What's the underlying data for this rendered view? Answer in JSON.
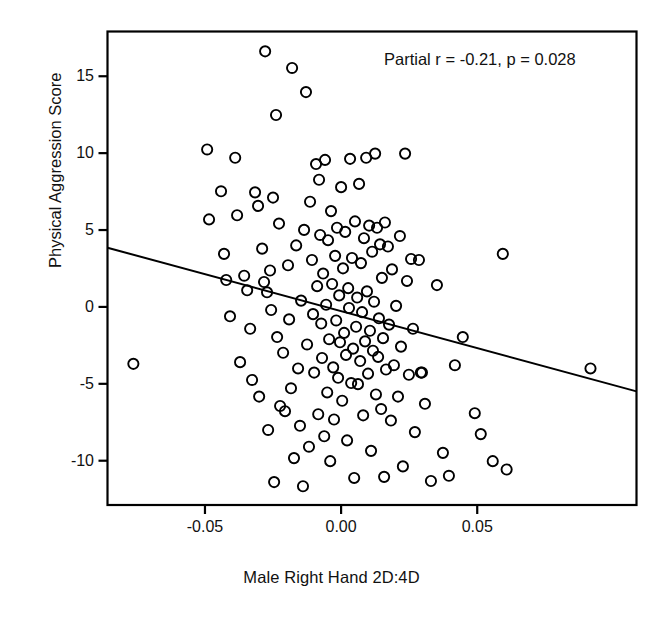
{
  "chart_data": {
    "type": "scatter",
    "title": "",
    "xlabel": "Male Right Hand 2D:4D",
    "ylabel": "Physical Aggression Score",
    "annotation": "Partial r = -0.21, p = 0.028",
    "partial_r": -0.21,
    "p_value": 0.028,
    "grid": false,
    "legend": "none",
    "xlim": [
      -0.0858,
      0.1085
    ],
    "ylim": [
      -12.88,
      17.91
    ],
    "xticks": [
      -0.05,
      0.0,
      0.05
    ],
    "xticklabels": [
      "-0.05",
      "0.00",
      "0.05"
    ],
    "yticks": [
      -10,
      -5,
      0,
      5,
      10,
      15
    ],
    "yticklabels": [
      "-10",
      "-5",
      "0",
      "5",
      "10",
      "15"
    ],
    "marker": "open-circle",
    "marker_color": "#000000",
    "n_points": 152,
    "trendline": {
      "type": "linear",
      "x_start": -0.0858,
      "y_start": 3.85,
      "x_end": 0.1085,
      "y_end": -5.49,
      "color": "#000000"
    },
    "points": [
      {
        "x": -0.0763,
        "y": -3.7
      },
      {
        "x": -0.0492,
        "y": 10.24
      },
      {
        "x": -0.0485,
        "y": 5.69
      },
      {
        "x": -0.0441,
        "y": 7.52
      },
      {
        "x": -0.043,
        "y": 3.45
      },
      {
        "x": -0.0422,
        "y": 1.75
      },
      {
        "x": -0.0408,
        "y": -0.61
      },
      {
        "x": -0.0389,
        "y": 9.7
      },
      {
        "x": -0.0382,
        "y": 5.96
      },
      {
        "x": -0.0371,
        "y": -3.59
      },
      {
        "x": -0.0356,
        "y": 2.03
      },
      {
        "x": -0.0345,
        "y": 1.08
      },
      {
        "x": -0.0334,
        "y": -1.42
      },
      {
        "x": -0.0327,
        "y": -4.75
      },
      {
        "x": -0.0316,
        "y": 7.45
      },
      {
        "x": -0.0305,
        "y": 6.57
      },
      {
        "x": -0.0301,
        "y": -5.83
      },
      {
        "x": -0.029,
        "y": 3.79
      },
      {
        "x": -0.0283,
        "y": 1.62
      },
      {
        "x": -0.0279,
        "y": 16.62
      },
      {
        "x": -0.0272,
        "y": 0.95
      },
      {
        "x": -0.0268,
        "y": -8.0
      },
      {
        "x": -0.0261,
        "y": 2.37
      },
      {
        "x": -0.0257,
        "y": -0.2
      },
      {
        "x": -0.025,
        "y": 7.11
      },
      {
        "x": -0.0246,
        "y": -11.39
      },
      {
        "x": -0.0239,
        "y": 12.48
      },
      {
        "x": -0.0235,
        "y": -1.96
      },
      {
        "x": -0.0228,
        "y": 5.42
      },
      {
        "x": -0.0224,
        "y": -6.44
      },
      {
        "x": -0.0213,
        "y": -2.98
      },
      {
        "x": -0.0206,
        "y": -6.78
      },
      {
        "x": -0.0195,
        "y": 2.71
      },
      {
        "x": -0.0191,
        "y": -0.81
      },
      {
        "x": -0.0184,
        "y": -5.29
      },
      {
        "x": -0.018,
        "y": 15.54
      },
      {
        "x": -0.0173,
        "y": -9.83
      },
      {
        "x": -0.0165,
        "y": 4.0
      },
      {
        "x": -0.0158,
        "y": -4.0
      },
      {
        "x": -0.0151,
        "y": -7.73
      },
      {
        "x": -0.0147,
        "y": 0.41
      },
      {
        "x": -0.014,
        "y": -11.66
      },
      {
        "x": -0.0136,
        "y": 5.01
      },
      {
        "x": -0.0129,
        "y": 13.97
      },
      {
        "x": -0.0125,
        "y": -2.44
      },
      {
        "x": -0.0118,
        "y": -9.09
      },
      {
        "x": -0.0114,
        "y": 6.84
      },
      {
        "x": -0.0107,
        "y": 3.05
      },
      {
        "x": -0.0103,
        "y": -0.47
      },
      {
        "x": -0.0099,
        "y": -4.27
      },
      {
        "x": -0.0092,
        "y": 9.29
      },
      {
        "x": -0.0088,
        "y": 1.35
      },
      {
        "x": -0.0084,
        "y": -6.98
      },
      {
        "x": -0.0081,
        "y": 8.27
      },
      {
        "x": -0.0077,
        "y": 4.68
      },
      {
        "x": -0.0073,
        "y": -1.08
      },
      {
        "x": -0.007,
        "y": -3.32
      },
      {
        "x": -0.0066,
        "y": 2.17
      },
      {
        "x": -0.0062,
        "y": -8.41
      },
      {
        "x": -0.0059,
        "y": 9.56
      },
      {
        "x": -0.0055,
        "y": 0.14
      },
      {
        "x": -0.0051,
        "y": -5.56
      },
      {
        "x": -0.0048,
        "y": 4.34
      },
      {
        "x": -0.0044,
        "y": -2.1
      },
      {
        "x": -0.004,
        "y": -10.03
      },
      {
        "x": -0.0037,
        "y": 6.23
      },
      {
        "x": -0.0033,
        "y": 1.49
      },
      {
        "x": -0.0029,
        "y": -3.93
      },
      {
        "x": -0.0026,
        "y": -7.32
      },
      {
        "x": -0.0022,
        "y": 3.32
      },
      {
        "x": -0.0018,
        "y": -0.88
      },
      {
        "x": -0.0015,
        "y": 5.15
      },
      {
        "x": -0.0011,
        "y": -4.61
      },
      {
        "x": -0.0007,
        "y": 0.75
      },
      {
        "x": -0.0004,
        "y": -2.3
      },
      {
        "x": 0.0,
        "y": 7.79
      },
      {
        "x": 0.0004,
        "y": -6.1
      },
      {
        "x": 0.0007,
        "y": 2.51
      },
      {
        "x": 0.0011,
        "y": -1.69
      },
      {
        "x": 0.0015,
        "y": 4.88
      },
      {
        "x": 0.0018,
        "y": -3.12
      },
      {
        "x": 0.0022,
        "y": -8.68
      },
      {
        "x": 0.0026,
        "y": 1.22
      },
      {
        "x": 0.0029,
        "y": -0.07
      },
      {
        "x": 0.0033,
        "y": 9.63
      },
      {
        "x": 0.0037,
        "y": -4.95
      },
      {
        "x": 0.004,
        "y": 3.18
      },
      {
        "x": 0.0044,
        "y": -2.71
      },
      {
        "x": 0.0048,
        "y": -11.12
      },
      {
        "x": 0.0051,
        "y": 5.56
      },
      {
        "x": 0.0055,
        "y": -1.29
      },
      {
        "x": 0.0059,
        "y": 0.61
      },
      {
        "x": 0.0062,
        "y": -5.02
      },
      {
        "x": 0.0066,
        "y": 8.0
      },
      {
        "x": 0.007,
        "y": -3.52
      },
      {
        "x": 0.0073,
        "y": 2.85
      },
      {
        "x": 0.0077,
        "y": -0.34
      },
      {
        "x": 0.0081,
        "y": -7.05
      },
      {
        "x": 0.0084,
        "y": 4.47
      },
      {
        "x": 0.0088,
        "y": -2.24
      },
      {
        "x": 0.0092,
        "y": 9.7
      },
      {
        "x": 0.0095,
        "y": 1.01
      },
      {
        "x": 0.0099,
        "y": -4.34
      },
      {
        "x": 0.0103,
        "y": 5.29
      },
      {
        "x": 0.0106,
        "y": -1.55
      },
      {
        "x": 0.011,
        "y": -9.36
      },
      {
        "x": 0.0114,
        "y": 3.59
      },
      {
        "x": 0.0117,
        "y": -2.85
      },
      {
        "x": 0.0121,
        "y": 0.34
      },
      {
        "x": 0.0125,
        "y": 9.97
      },
      {
        "x": 0.0128,
        "y": -5.69
      },
      {
        "x": 0.0132,
        "y": 5.15
      },
      {
        "x": 0.0136,
        "y": -3.25
      },
      {
        "x": 0.0139,
        "y": -0.74
      },
      {
        "x": 0.0143,
        "y": 4.07
      },
      {
        "x": 0.0147,
        "y": -6.64
      },
      {
        "x": 0.015,
        "y": 1.89
      },
      {
        "x": 0.0154,
        "y": -2.03
      },
      {
        "x": 0.0158,
        "y": -11.05
      },
      {
        "x": 0.0161,
        "y": 5.49
      },
      {
        "x": 0.0165,
        "y": -4.07
      },
      {
        "x": 0.0172,
        "y": 3.93
      },
      {
        "x": 0.0176,
        "y": -1.15
      },
      {
        "x": 0.0183,
        "y": -7.39
      },
      {
        "x": 0.0187,
        "y": 2.44
      },
      {
        "x": 0.0194,
        "y": -3.79
      },
      {
        "x": 0.0202,
        "y": 0.07
      },
      {
        "x": 0.0209,
        "y": -5.83
      },
      {
        "x": 0.0216,
        "y": 4.61
      },
      {
        "x": 0.022,
        "y": -2.58
      },
      {
        "x": 0.0227,
        "y": -10.37
      },
      {
        "x": 0.0235,
        "y": 9.97
      },
      {
        "x": 0.0242,
        "y": 1.69
      },
      {
        "x": 0.0249,
        "y": -4.41
      },
      {
        "x": 0.0257,
        "y": 3.12
      },
      {
        "x": 0.0264,
        "y": -1.42
      },
      {
        "x": 0.0271,
        "y": -8.14
      },
      {
        "x": 0.0286,
        "y": 3.05
      },
      {
        "x": 0.0293,
        "y": -4.27
      },
      {
        "x": 0.0297,
        "y": -4.27
      },
      {
        "x": 0.0308,
        "y": -6.3
      },
      {
        "x": 0.033,
        "y": -11.32
      },
      {
        "x": 0.0352,
        "y": 1.42
      },
      {
        "x": 0.0374,
        "y": -9.49
      },
      {
        "x": 0.0396,
        "y": -10.98
      },
      {
        "x": 0.0418,
        "y": -3.79
      },
      {
        "x": 0.0447,
        "y": -1.96
      },
      {
        "x": 0.0491,
        "y": -6.91
      },
      {
        "x": 0.0513,
        "y": -8.27
      },
      {
        "x": 0.0557,
        "y": -10.03
      },
      {
        "x": 0.0594,
        "y": 3.45
      },
      {
        "x": 0.0608,
        "y": -10.57
      },
      {
        "x": 0.0916,
        "y": -4.0
      }
    ]
  }
}
